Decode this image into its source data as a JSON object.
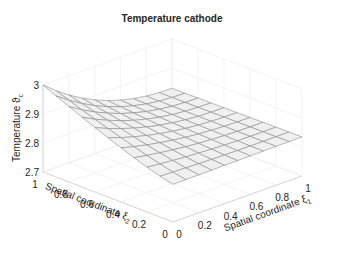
{
  "chart_data": {
    "type": "surface",
    "title": "Temperature cathode",
    "xlabel": "Spatial coordinate",
    "xlabel_symbol": "ξ",
    "xlabel_subscript": "1",
    "ylabel": "Spatial coordinate",
    "ylabel_symbol": "ξ",
    "ylabel_subscript": "2",
    "zlabel": "Temperature",
    "zlabel_symbol": "ϑ",
    "zlabel_subscript": "c",
    "x_ticks": [
      "0",
      "0.2",
      "0.4",
      "0.6",
      "0.8",
      "1"
    ],
    "y_ticks": [
      "0",
      "0.2",
      "0.4",
      "0.6",
      "0.8",
      "1"
    ],
    "z_ticks": [
      "2.7",
      "2.8",
      "2.9",
      "3"
    ],
    "xlim": [
      0,
      1
    ],
    "ylim": [
      0,
      1
    ],
    "zlim": [
      2.7,
      3.0
    ],
    "grid": true,
    "mesh_resolution": 11,
    "corner_values": {
      "xi1_0_xi2_0": 2.83,
      "xi1_1_xi2_0": 2.84,
      "xi1_1_xi2_1": 2.83,
      "xi1_0_xi2_1": 3.0
    },
    "colors": {
      "surface_face": "#f0f0f0",
      "surface_edge": "#8c8c8c",
      "grid": "#ebebeb",
      "axis": "#cfcfcf",
      "text": "#262626"
    }
  }
}
